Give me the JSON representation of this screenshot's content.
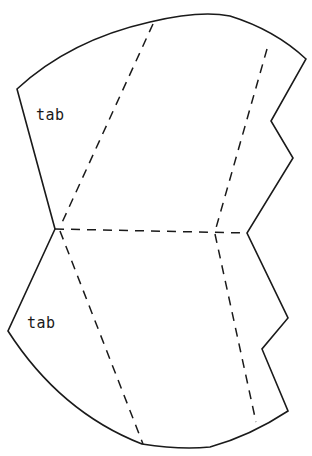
{
  "diagram": {
    "type": "paper-net-template",
    "colors": {
      "line": "#1a1a1a",
      "background": "#ffffff"
    },
    "labels": [
      {
        "id": "tab-upper",
        "text": "tab",
        "x": 36,
        "y": 106
      },
      {
        "id": "tab-lower",
        "text": "tab",
        "x": 27,
        "y": 314
      }
    ],
    "outline_path": "M17,89 Q70,40 150,22 Q200,10 230,16 Q275,30 306,59 L271,121 L293,158 L247,233 L288,318 L262,349 L288,411 Q250,436 210,447 Q180,450 142,444 Q60,412 8,331 L55,229 Z",
    "fold_lines": [
      {
        "id": "fold-upper-left",
        "x1": 153,
        "y1": 24,
        "x2": 60,
        "y2": 227
      },
      {
        "id": "fold-upper-right",
        "x1": 267,
        "y1": 49,
        "x2": 216,
        "y2": 228
      },
      {
        "id": "fold-waist",
        "x1": 55,
        "y1": 229,
        "x2": 247,
        "y2": 233
      },
      {
        "id": "fold-lower-left",
        "x1": 60,
        "y1": 231,
        "x2": 143,
        "y2": 444
      },
      {
        "id": "fold-lower-right",
        "x1": 215,
        "y1": 234,
        "x2": 256,
        "y2": 422
      }
    ]
  }
}
